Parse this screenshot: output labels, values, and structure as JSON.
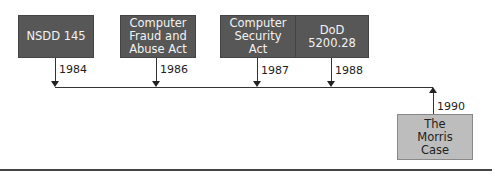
{
  "events": [
    {
      "label": "NSDD 145",
      "year": "1984"
    },
    {
      "label": "Computer Fraud and Abuse Act",
      "year": "1986"
    },
    {
      "label": "Computer Security Act",
      "year": "1987"
    },
    {
      "label": "DoD 5200.28",
      "year": "1988"
    },
    {
      "label": "The Morris Case",
      "year": "1990"
    }
  ],
  "colors": {
    "dark_box": "#575757",
    "light_box": "#bdbdbd",
    "line": "#333333"
  }
}
